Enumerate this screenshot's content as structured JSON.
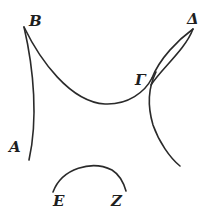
{
  "figure": {
    "type": "geometric-diagram",
    "labels": {
      "B": "B",
      "Delta": "Δ",
      "Gamma": "Γ",
      "A": "A",
      "E": "E",
      "Z": "Z"
    },
    "curves": [
      {
        "name": "curve-B-A",
        "from": "B",
        "to": "A"
      },
      {
        "name": "curve-B-Gamma",
        "from": "B",
        "to": "Γ"
      },
      {
        "name": "curve-Gamma-Delta-outer",
        "from": "Γ",
        "to": "Δ"
      },
      {
        "name": "curve-Gamma-Delta-inner",
        "from": "Γ",
        "to": "Δ"
      },
      {
        "name": "curve-Gamma-down",
        "from": "Γ",
        "to": "below"
      },
      {
        "name": "arc-E-Z",
        "from": "E",
        "to": "Z"
      }
    ],
    "stroke_color": "#2a2a2a",
    "background": "#ffffff"
  }
}
